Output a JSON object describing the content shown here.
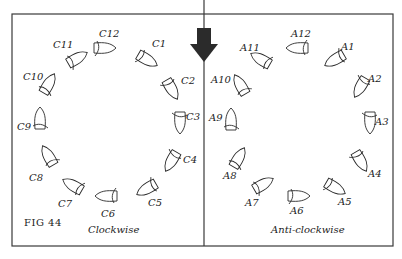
{
  "figure": {
    "label": "FIG 44",
    "panels": [
      {
        "id": "clockwise",
        "caption": "Clockwise",
        "boats": [
          {
            "label": "C12",
            "x": 103,
            "y": 48,
            "angle": 90
          },
          {
            "label": "C1",
            "x": 146,
            "y": 59,
            "angle": 120
          },
          {
            "label": "C2",
            "x": 171,
            "y": 88,
            "angle": 150
          },
          {
            "label": "C3",
            "x": 180,
            "y": 121,
            "angle": 180
          },
          {
            "label": "C4",
            "x": 172,
            "y": 160,
            "angle": 210
          },
          {
            "label": "C5",
            "x": 148,
            "y": 188,
            "angle": 240
          },
          {
            "label": "C6",
            "x": 108,
            "y": 196,
            "angle": 270
          },
          {
            "label": "C7",
            "x": 74,
            "y": 186,
            "angle": 300
          },
          {
            "label": "C8",
            "x": 49,
            "y": 157,
            "angle": 330
          },
          {
            "label": "C9",
            "x": 40,
            "y": 120,
            "angle": 0
          },
          {
            "label": "C10",
            "x": 48,
            "y": 85,
            "angle": 30
          },
          {
            "label": "C11",
            "x": 76,
            "y": 59,
            "angle": 60
          }
        ],
        "labels": [
          {
            "text": "C12",
            "x": 99,
            "y": 37
          },
          {
            "text": "C1",
            "x": 152,
            "y": 47
          },
          {
            "text": "C2",
            "x": 181,
            "y": 84
          },
          {
            "text": "C3",
            "x": 186,
            "y": 120
          },
          {
            "text": "C4",
            "x": 183,
            "y": 163
          },
          {
            "text": "C5",
            "x": 148,
            "y": 206
          },
          {
            "text": "C6",
            "x": 101,
            "y": 217
          },
          {
            "text": "C7",
            "x": 58,
            "y": 207
          },
          {
            "text": "C8",
            "x": 29,
            "y": 181
          },
          {
            "text": "C9",
            "x": 17,
            "y": 130
          },
          {
            "text": "C10",
            "x": 23,
            "y": 80
          },
          {
            "text": "C11",
            "x": 53,
            "y": 48
          }
        ]
      },
      {
        "id": "anti-clockwise",
        "caption": "Anti-clockwise",
        "boats": [
          {
            "label": "A12",
            "x": 299,
            "y": 48,
            "angle": 270
          },
          {
            "label": "A1",
            "x": 336,
            "y": 59,
            "angle": 240
          },
          {
            "label": "A2",
            "x": 361,
            "y": 86,
            "angle": 210
          },
          {
            "label": "A3",
            "x": 370,
            "y": 121,
            "angle": 180
          },
          {
            "label": "A4",
            "x": 360,
            "y": 160,
            "angle": 150
          },
          {
            "label": "A5",
            "x": 334,
            "y": 187,
            "angle": 120
          },
          {
            "label": "A6",
            "x": 297,
            "y": 196,
            "angle": 90
          },
          {
            "label": "A7",
            "x": 262,
            "y": 185,
            "angle": 60
          },
          {
            "label": "A8",
            "x": 238,
            "y": 159,
            "angle": 30
          },
          {
            "label": "A9",
            "x": 231,
            "y": 121,
            "angle": 0
          },
          {
            "label": "A10",
            "x": 241,
            "y": 86,
            "angle": 330
          },
          {
            "label": "A11",
            "x": 262,
            "y": 60,
            "angle": 300
          }
        ],
        "labels": [
          {
            "text": "A12",
            "x": 291,
            "y": 37
          },
          {
            "text": "A1",
            "x": 341,
            "y": 50
          },
          {
            "text": "A2",
            "x": 368,
            "y": 82
          },
          {
            "text": "A3",
            "x": 375,
            "y": 125
          },
          {
            "text": "A4",
            "x": 368,
            "y": 177
          },
          {
            "text": "A5",
            "x": 338,
            "y": 205
          },
          {
            "text": "A6",
            "x": 290,
            "y": 214
          },
          {
            "text": "A7",
            "x": 245,
            "y": 206
          },
          {
            "text": "A8",
            "x": 223,
            "y": 179
          },
          {
            "text": "A9",
            "x": 209,
            "y": 121
          },
          {
            "text": "A10",
            "x": 211,
            "y": 83
          },
          {
            "text": "A11",
            "x": 240,
            "y": 51
          }
        ]
      }
    ],
    "arrow": {
      "direction": "down",
      "color": "#2b2b2b"
    },
    "colors": {
      "line": "#2a2a2a",
      "background": "#ffffff"
    }
  }
}
